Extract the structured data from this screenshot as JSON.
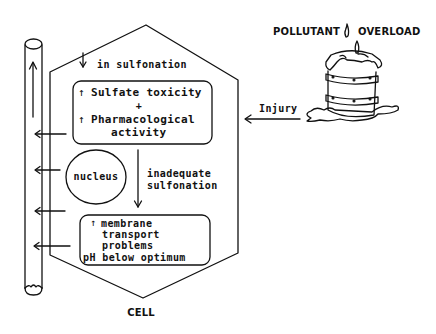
{
  "diagram": {
    "type": "cell-pathway-diagram",
    "title_right": {
      "left_word": "POLLUTANT",
      "right_word": "OVERLOAD",
      "icon": "flame-drop-icon"
    },
    "cell_label": "CELL",
    "injury_label": "Injury",
    "top_note": {
      "arrow": "↓",
      "text": "in sulfonation"
    },
    "top_box": {
      "line1_arrow": "↑",
      "line1": "Sulfate toxicity",
      "plus": "+",
      "line2_arrow": "↑",
      "line2": "Pharmacological",
      "line3": "activity"
    },
    "nucleus_label": "nucleus",
    "middle_note": {
      "line1": "inadequate",
      "line2": "sulfonation"
    },
    "bottom_box": {
      "line1_arrow": "↑",
      "line1": "membrane",
      "line2": "transport",
      "line3": "problems",
      "line4": "pH below optimum"
    },
    "edges": [
      {
        "from": "pollutant-candle",
        "to": "cell",
        "label": "Injury"
      },
      {
        "from": "top-note",
        "to": "top-box"
      },
      {
        "from": "top-box",
        "to": "bottom-box",
        "label": "inadequate sulfonation"
      },
      {
        "from": "top-box",
        "to": "vessel-tube"
      },
      {
        "from": "nucleus",
        "to": "vessel-tube"
      },
      {
        "from": "cell-lower",
        "to": "vessel-tube"
      },
      {
        "from": "bottom-box",
        "to": "vessel-tube"
      }
    ],
    "colors": {
      "line": "#111111",
      "background": "#ffffff"
    }
  }
}
